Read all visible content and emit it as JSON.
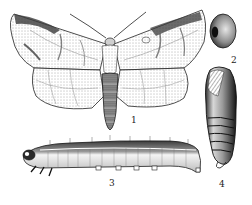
{
  "figure": {
    "type": "scientific-illustration",
    "style": "black-and-white engraving",
    "colors": {
      "ink": "#1a1a1a",
      "paper": "#ffffff",
      "shade": "#8a8a8a"
    },
    "specimens": [
      {
        "id": "adult",
        "label": "1",
        "description": "adult moth, wings spread"
      },
      {
        "id": "egg",
        "label": "2",
        "description": "egg"
      },
      {
        "id": "larva",
        "label": "3",
        "description": "larva (caterpillar), lateral view"
      },
      {
        "id": "pupa",
        "label": "4",
        "description": "pupa"
      }
    ]
  }
}
